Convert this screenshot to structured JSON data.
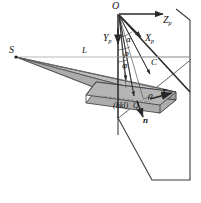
{
  "figure": {
    "type": "geometry-diagram",
    "background_color": "#ffffff",
    "line_color": "#2a2a2a",
    "fan_fill": "#b9b9b9",
    "plate_fill": "#9e9e9e",
    "thin_line_color": "#8a8a8a"
  },
  "labels": {
    "origin": "O",
    "source": "S",
    "distance": "L",
    "axis_z": "Z",
    "axis_z_sub": "p",
    "axis_x": "X",
    "axis_x_sub": "p",
    "axis_y": "Y",
    "axis_y_sub": "p",
    "point_c": "C",
    "angle_alpha": "α",
    "angle_rho_upper": "ρ",
    "angle_rho_lower": "ρ",
    "angle_phi": "φ",
    "miller_index": "(hkl)",
    "point_q": "Q",
    "vector_r": "r",
    "normal_n": "n"
  },
  "elements": [
    {
      "name": "origin-point",
      "label": "O"
    },
    {
      "name": "source-point",
      "label": "S"
    },
    {
      "name": "detector-plane",
      "label": ""
    },
    {
      "name": "diffraction-fan",
      "label": ""
    },
    {
      "name": "crystal-plate",
      "label": ""
    },
    {
      "name": "axis-zp-arrow",
      "label": "Zp"
    },
    {
      "name": "axis-xp-arrow",
      "label": "Xp"
    },
    {
      "name": "axis-yp-arrow",
      "label": "Yp"
    },
    {
      "name": "normal-vector-arrow",
      "label": "n"
    },
    {
      "name": "scattering-vector-arrow",
      "label": "r"
    },
    {
      "name": "distance-line",
      "label": "L"
    }
  ]
}
